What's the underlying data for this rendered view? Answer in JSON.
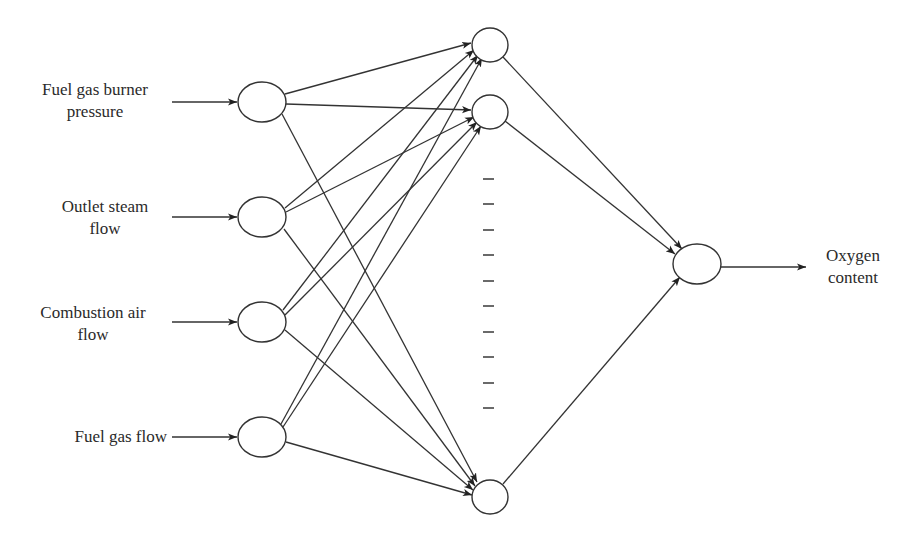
{
  "diagram": {
    "type": "neural-network",
    "inputs": [
      {
        "label_line1": "Fuel gas burner",
        "label_line2": "pressure"
      },
      {
        "label_line1": "Outlet steam",
        "label_line2": "flow"
      },
      {
        "label_line1": "Combustion air",
        "label_line2": "flow"
      },
      {
        "label_line1": "Fuel gas flow",
        "label_line2": ""
      }
    ],
    "hidden_layer": {
      "visible_nodes": 3,
      "ellipsis": "– – – – – – – – – –"
    },
    "output": {
      "label_line1": "Oxygen",
      "label_line2": "content"
    },
    "colors": {
      "stroke": "#333333",
      "background": "#ffffff",
      "text": "#2a2a2a"
    }
  }
}
